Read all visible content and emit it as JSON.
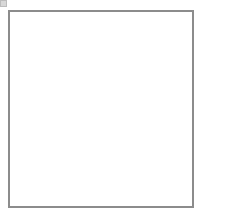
{
  "chart_data": {
    "type": "table",
    "columns": 15,
    "rows": 16,
    "row_labels": [
      "15",
      "13",
      "11",
      "9",
      "7",
      "5",
      "3",
      "1"
    ],
    "symbol_legend": {
      "O": "yarn-over",
      "/": "k2tog-right-leaning-decrease",
      "\\": "ssk-left-leaning-decrease",
      "L": "centered-double-decrease-right",
      "K": "centered-double-decrease-left",
      "X": "no-stitch-shaded-cell",
      "": "knit-blank"
    },
    "colors": {
      "grid_line": "#9a9a9a",
      "border": "#8c8c8c",
      "no_stitch_fill": "#b4b4b4",
      "row_number": "#6b6b6b",
      "background": "#ffffff"
    },
    "cells": [
      [
        "O",
        "\\",
        "O",
        "",
        "O",
        "",
        "",
        "/",
        "O",
        "",
        "",
        "/",
        "O",
        "/",
        "O"
      ],
      [
        "",
        "",
        "",
        "X",
        "",
        "",
        "",
        "",
        "",
        "",
        "X",
        "",
        "",
        "",
        ""
      ],
      [
        "O",
        "L",
        "O",
        "X",
        "",
        "",
        "O",
        "",
        "",
        "/",
        "X",
        "O",
        "/",
        "O",
        ""
      ],
      [
        "",
        "",
        "X",
        "",
        "\\",
        "",
        "",
        "",
        "",
        "",
        "X",
        "",
        "",
        "",
        ""
      ],
      [
        "O",
        "\\",
        "X",
        "L",
        "L",
        "O",
        "",
        "O",
        "",
        "",
        "/",
        "X",
        "O",
        "/",
        "O"
      ],
      [
        "",
        "",
        "X",
        "",
        "",
        "",
        "",
        "",
        "",
        "",
        "X",
        "",
        "",
        "",
        ""
      ],
      [
        "O",
        "\\",
        "O",
        "\\",
        "\\",
        "\\",
        "",
        "",
        "O",
        "",
        "",
        "",
        "O",
        "/",
        "O"
      ],
      [
        "",
        "",
        "",
        "",
        "",
        "",
        "",
        "",
        "",
        "",
        "",
        "",
        "",
        "",
        ""
      ],
      [
        "O",
        "\\",
        "O",
        "\\",
        "",
        "",
        "O",
        "\\",
        "",
        "",
        "O",
        "",
        "O",
        "/",
        "O"
      ],
      [
        "",
        "",
        "",
        "X",
        "",
        "",
        "",
        "",
        "",
        "",
        "X",
        "",
        "",
        "",
        ""
      ],
      [
        "O",
        "\\",
        "O",
        "X",
        "\\",
        "",
        "",
        "O",
        "",
        "",
        "X",
        "O",
        "K",
        "O",
        ""
      ],
      [
        "",
        "",
        "",
        "X",
        "",
        "",
        "",
        "",
        "",
        "/",
        "X",
        "X",
        "",
        "",
        ""
      ],
      [
        "O",
        "\\",
        "O",
        "X",
        "\\",
        "",
        "",
        "O",
        "",
        "O",
        "K",
        "K",
        "X",
        "/",
        "O"
      ],
      [
        "",
        "",
        "",
        "",
        "",
        "",
        "",
        "",
        "",
        "",
        "",
        "",
        "",
        "",
        ""
      ],
      [
        "O",
        "\\",
        "O",
        "",
        "",
        "",
        "O",
        "",
        "",
        "/",
        "/",
        "/",
        "O",
        "/",
        "O"
      ],
      [
        "",
        "",
        "",
        "",
        "",
        "",
        "",
        "",
        "",
        "",
        "",
        "",
        "",
        "",
        ""
      ]
    ],
    "row_number_positions": [
      1,
      3,
      5,
      7,
      9,
      11,
      13,
      15
    ]
  }
}
